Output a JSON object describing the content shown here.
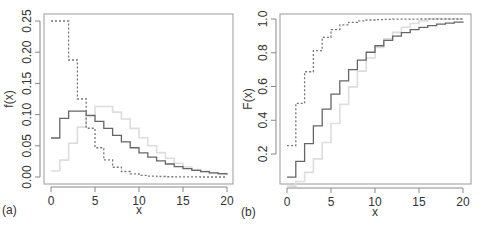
{
  "figure": {
    "panels": [
      "(a)",
      "(b)"
    ]
  },
  "chart_data": [
    {
      "type": "line",
      "subtype": "step",
      "panel_label": "(a)",
      "title": "",
      "xlabel": "x",
      "ylabel": "f(x)",
      "xlim": [
        0,
        20
      ],
      "ylim": [
        0,
        0.25
      ],
      "xticks": [
        "0",
        "5",
        "10",
        "15",
        "20"
      ],
      "yticks": [
        "0.00",
        "0.05",
        "0.10",
        "0.15",
        "0.20",
        "0.25"
      ],
      "grid": false,
      "legend": null,
      "x": [
        0,
        1,
        2,
        3,
        4,
        5,
        6,
        7,
        8,
        9,
        10,
        11,
        12,
        13,
        14,
        15,
        16,
        17,
        18,
        19,
        20
      ],
      "series": [
        {
          "name": "dashed",
          "style": "dashed",
          "color": "#777777",
          "values": [
            0.25,
            0.25,
            0.1875,
            0.125,
            0.0781,
            0.0469,
            0.0273,
            0.0156,
            0.0088,
            0.0049,
            0.0027,
            0.0015,
            0.0008,
            0.0004,
            0.0002,
            0.0001,
            0.0001,
            0.0,
            0.0,
            0.0,
            0.0
          ]
        },
        {
          "name": "solid-dark",
          "style": "solid",
          "color": "#666666",
          "values": [
            0.0625,
            0.0938,
            0.1055,
            0.1055,
            0.0989,
            0.089,
            0.0779,
            0.0667,
            0.0563,
            0.0469,
            0.0387,
            0.0317,
            0.0257,
            0.0208,
            0.0167,
            0.0134,
            0.0107,
            0.0085,
            0.0067,
            0.0053,
            0.0042
          ]
        },
        {
          "name": "solid-light",
          "style": "solid",
          "color": "#dddddd",
          "values": [
            0.0096,
            0.027,
            0.054,
            0.08,
            0.097,
            0.113,
            0.113,
            0.104,
            0.093,
            0.078,
            0.063,
            0.05,
            0.039,
            0.03,
            0.022,
            0.016,
            0.012,
            0.009,
            0.006,
            0.004,
            0.003
          ]
        }
      ]
    },
    {
      "type": "line",
      "subtype": "step",
      "panel_label": "(b)",
      "title": "",
      "xlabel": "x",
      "ylabel": "F(x)",
      "xlim": [
        0,
        20
      ],
      "ylim": [
        0.05,
        1.0
      ],
      "xticks": [
        "0",
        "5",
        "10",
        "15",
        "20"
      ],
      "yticks": [
        "0.2",
        "0.4",
        "0.6",
        "0.8",
        "1.0"
      ],
      "grid": false,
      "legend": null,
      "x": [
        0,
        1,
        2,
        3,
        4,
        5,
        6,
        7,
        8,
        9,
        10,
        11,
        12,
        13,
        14,
        15,
        16,
        17,
        18,
        19,
        20
      ],
      "series": [
        {
          "name": "dashed",
          "style": "dashed",
          "color": "#777777",
          "values": [
            0.25,
            0.5,
            0.6875,
            0.8125,
            0.8906,
            0.9375,
            0.9648,
            0.9805,
            0.9893,
            0.9941,
            0.9968,
            0.9983,
            0.9991,
            0.9995,
            0.9997,
            0.9999,
            0.9999,
            1.0,
            1.0,
            1.0,
            1.0
          ]
        },
        {
          "name": "solid-dark",
          "style": "solid",
          "color": "#666666",
          "values": [
            0.0625,
            0.1563,
            0.2617,
            0.3672,
            0.4661,
            0.5551,
            0.6329,
            0.6997,
            0.756,
            0.8029,
            0.8416,
            0.8733,
            0.899,
            0.9198,
            0.9365,
            0.9499,
            0.9606,
            0.9691,
            0.9758,
            0.9811,
            0.9853
          ]
        },
        {
          "name": "solid-light",
          "style": "solid",
          "color": "#dddddd",
          "values": [
            0.0096,
            0.037,
            0.091,
            0.171,
            0.268,
            0.381,
            0.494,
            0.598,
            0.691,
            0.769,
            0.832,
            0.882,
            0.921,
            0.951,
            0.973,
            0.989,
            1.0,
            1.0,
            1.0,
            1.0,
            1.0
          ]
        }
      ]
    }
  ]
}
